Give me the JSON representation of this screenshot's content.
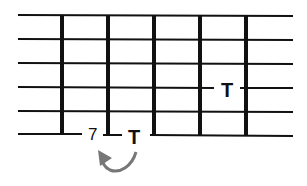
{
  "diagram": {
    "type": "guitar-fretboard-tab",
    "strings": 6,
    "frets": 5,
    "colors": {
      "line": "#111111",
      "arrow": "#777777",
      "background": "#ffffff"
    },
    "annotations": [
      {
        "id": "fret-number",
        "text": "7",
        "string": 6,
        "position": "before-fret-2"
      },
      {
        "id": "tap-low",
        "text": "T",
        "string": 6,
        "position": "fret-3"
      },
      {
        "id": "tap-high",
        "text": "T",
        "string": 3,
        "position": "fret-5"
      }
    ],
    "arrow": {
      "from": "tap-low",
      "to": "fret-number",
      "shape": "curved"
    }
  }
}
